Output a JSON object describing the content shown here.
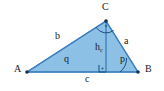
{
  "figure": {
    "kind": "geometry-diagram",
    "width": 164,
    "height": 91,
    "background_color": "#ffffff",
    "fill_color": "#8CC0E4",
    "stroke_color": "#3C7FBF",
    "label_color": "#1a1a1a"
  },
  "vertices": [
    {
      "key": "A",
      "label": "A",
      "x": 27,
      "y": 72,
      "label_x": 14,
      "label_y": 67
    },
    {
      "key": "B",
      "label": "B",
      "x": 138,
      "y": 72,
      "label_x": 145,
      "label_y": 67
    },
    {
      "key": "C",
      "label": "C",
      "x": 106,
      "y": 21,
      "label_x": 102,
      "label_y": 3
    }
  ],
  "sides": [
    {
      "key": "a",
      "label": "a",
      "from": "C",
      "to": "B",
      "label_x": 124,
      "label_y": 38
    },
    {
      "key": "b",
      "label": "b",
      "from": "A",
      "to": "C",
      "label_x": 55,
      "label_y": 33
    },
    {
      "key": "c",
      "label": "c",
      "from": "A",
      "to": "B",
      "label_x": 85,
      "label_y": 74
    }
  ],
  "segments": [
    {
      "key": "h_c",
      "label": "h",
      "sublabel": "c",
      "description": "altitude from C perpendicular to side c",
      "from_x": 106,
      "from_y": 21,
      "to_x": 106,
      "to_y": 72,
      "label_x": 95,
      "label_y": 44
    },
    {
      "key": "q",
      "label": "q",
      "description": "segment of base from A to foot of altitude",
      "from_x": 27,
      "from_y": 72,
      "to_x": 106,
      "to_y": 72,
      "label_x": 64,
      "label_y": 56
    }
  ],
  "angles": [
    {
      "key": "p",
      "label": "p",
      "at_vertex": "B",
      "marker": "arc",
      "label_x": 120,
      "label_y": 56
    },
    {
      "key": "gamma",
      "label": "",
      "at_vertex": "C",
      "marker": "arc-with-dot",
      "label_x": 0,
      "label_y": 0
    },
    {
      "key": "right-angle-foot",
      "label": "",
      "at_vertex": "foot of altitude",
      "marker": "right-angle-square-with-dot",
      "label_x": 0,
      "label_y": 0
    }
  ]
}
